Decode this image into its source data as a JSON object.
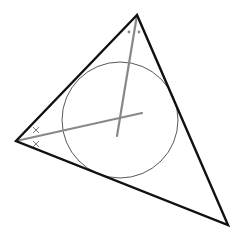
{
  "diagram": {
    "type": "geometry",
    "canvas": {
      "width": 242,
      "height": 243,
      "background": "#ffffff"
    },
    "triangle": {
      "vertices": {
        "A": {
          "x": 137,
          "y": 15
        },
        "B": {
          "x": 16,
          "y": 141
        },
        "C": {
          "x": 228,
          "y": 225
        }
      },
      "stroke": "#111111",
      "stroke_width": 2.4
    },
    "incircle": {
      "center": {
        "x": 120,
        "y": 120
      },
      "radius": 58,
      "stroke": "#444444",
      "stroke_width": 0.9
    },
    "bisectors": [
      {
        "from": "A",
        "x1": 137,
        "y1": 15,
        "x2": 117,
        "y2": 136,
        "stroke": "#888888",
        "stroke_width": 2.2
      },
      {
        "from": "B",
        "x1": 16,
        "y1": 141,
        "x2": 142,
        "y2": 113,
        "stroke": "#888888",
        "stroke_width": 2.2
      }
    ],
    "angle_marks": {
      "A": {
        "style": "dot",
        "color": "#888888",
        "points": [
          {
            "x": 129,
            "y": 32
          },
          {
            "x": 139,
            "y": 32
          }
        ]
      },
      "B": {
        "style": "cross",
        "glyph": "×",
        "color": "#777777",
        "points": [
          {
            "x": 36,
            "y": 130
          },
          {
            "x": 36,
            "y": 144
          }
        ]
      }
    }
  }
}
